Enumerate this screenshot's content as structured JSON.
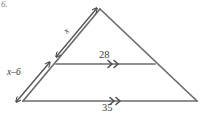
{
  "figure": {
    "problem_number": "6.",
    "type": "triangle-with-midsegment",
    "stroke_color": "#6b6b6b",
    "text_color": "#3b3b3b",
    "background_color": "#ffffff",
    "labels": {
      "upper_left_side": "x",
      "lower_left_side": "x–6",
      "midsegment": "28",
      "base": "35"
    },
    "marks": {
      "upper_left_side_mark": "double-headed-arrow",
      "lower_left_side_mark": "double-headed-arrow",
      "midsegment_mark": "double-chevron",
      "base_mark": "double-chevron"
    },
    "geometry": {
      "apex": [
        100,
        9
      ],
      "bottom_left": [
        23,
        101
      ],
      "bottom_right": [
        197,
        101
      ],
      "midsegment_left": [
        56,
        64
      ],
      "midsegment_right": [
        155,
        64
      ]
    }
  }
}
